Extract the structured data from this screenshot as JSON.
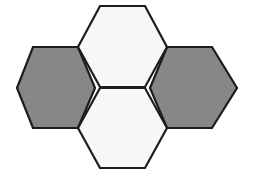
{
  "figure": {
    "canvas": {
      "width": 254,
      "height": 179,
      "background_color": "#ffffff"
    },
    "style": {
      "stroke_color": "#1c1c1c",
      "stroke_width": 2.2,
      "white_fill": "#f7f7f5",
      "gray_fill": "#878787"
    },
    "geometry": {
      "hex_half_width": 44,
      "hex_half_height": 41,
      "hex_flat_half": 22,
      "note": "flat-top hexagons; vertex order starts at left vertex and proceeds clockwise"
    },
    "shapes": [
      {
        "id": "hex-left",
        "label": "Left hexagon",
        "fill_name": "gray",
        "fill": "#878787",
        "center": {
          "x": 56,
          "y": 88
        },
        "points": "17,88 33,47 78,47 95,88 78,128 33,128"
      },
      {
        "id": "hex-top",
        "label": "Top hexagon",
        "fill_name": "white",
        "fill": "#f7f7f5",
        "center": {
          "x": 122,
          "y": 47
        },
        "points": "78,47 100,6 145,6 167,47 145,87 100,87"
      },
      {
        "id": "hex-right",
        "label": "Right hexagon",
        "fill_name": "gray",
        "fill": "#878787",
        "center": {
          "x": 189,
          "y": 88
        },
        "points": "150,88 167,47 212,47 237,88 212,128 167,128"
      },
      {
        "id": "hex-bottom",
        "label": "Bottom hexagon",
        "fill_name": "white",
        "fill": "#f7f7f5",
        "center": {
          "x": 122,
          "y": 128
        },
        "points": "78,128 100,88 145,88 167,128 145,168 100,168"
      }
    ]
  }
}
